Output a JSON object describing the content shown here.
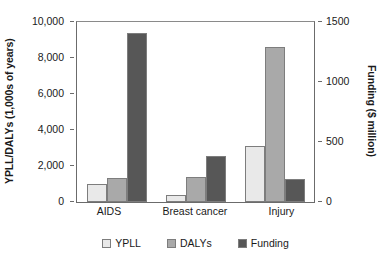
{
  "chart_data": {
    "type": "bar",
    "title": "",
    "subtitle": "",
    "xlabel": "",
    "categories": [
      "AIDS",
      "Breast cancer",
      "Injury"
    ],
    "series": [
      {
        "name": "YPLL",
        "axis": "left",
        "color": "#e9e9e9",
        "values": [
          1000,
          400,
          3100
        ]
      },
      {
        "name": "DALYs",
        "axis": "left",
        "color": "#a9a9a9",
        "values": [
          1350,
          1400,
          8600
        ]
      },
      {
        "name": "Funding",
        "axis": "right",
        "color": "#575757",
        "values": [
          1410,
          380,
          195
        ]
      }
    ],
    "axis_left": {
      "label": "YPLL/DALYs (1,000s of years)",
      "ticks": [
        "0",
        "2,000",
        "4,000",
        "6,000",
        "8,000",
        "10,000"
      ],
      "tick_values": [
        0,
        2000,
        4000,
        6000,
        8000,
        10000
      ],
      "min": 0,
      "max": 10000
    },
    "axis_right": {
      "label": "Funding ($ million)",
      "ticks": [
        "0",
        "500",
        "1000",
        "1500"
      ],
      "tick_values": [
        0,
        500,
        1000,
        1500
      ],
      "min": 0,
      "max": 1500
    },
    "legend": {
      "position": "bottom-center",
      "entries": [
        {
          "label": "YPLL",
          "color": "#e9e9e9"
        },
        {
          "label": "DALYs",
          "color": "#a9a9a9"
        },
        {
          "label": "Funding",
          "color": "#575757"
        }
      ]
    },
    "grid": false
  }
}
